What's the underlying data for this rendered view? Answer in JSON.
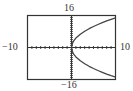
{
  "window": {
    "xmin": "−10",
    "xmax": "10",
    "ymin": "−16",
    "ymax": "16"
  },
  "colors": {
    "frame": "#333333",
    "axis": "#333333",
    "curve": "#444444",
    "background": "#ffffff"
  },
  "chart_data": {
    "type": "line",
    "title": "",
    "xlabel": "",
    "ylabel": "",
    "xlim": [
      -10,
      10
    ],
    "ylim": [
      -16,
      16
    ],
    "grid": false,
    "x_tick_step": 1,
    "y_tick_step": 1,
    "tick_labels": {
      "left": "−10",
      "right": "10",
      "top": "16",
      "bottom": "−16"
    },
    "series": [
      {
        "name": "upper branch",
        "x": [
          0,
          0.25,
          0.5,
          1,
          2,
          3,
          4,
          5,
          6,
          7,
          8,
          9,
          10
        ],
        "y": [
          0,
          2.3,
          3.3,
          4.7,
          6.6,
          8.1,
          9.4,
          10.5,
          11.5,
          12.4,
          13.3,
          14.1,
          14.8
        ]
      },
      {
        "name": "lower branch",
        "x": [
          0,
          0.25,
          0.5,
          1,
          2,
          3,
          4,
          5,
          6,
          7,
          8,
          9,
          10
        ],
        "y": [
          0,
          -2.3,
          -3.3,
          -4.7,
          -6.6,
          -8.1,
          -9.4,
          -10.5,
          -11.5,
          -12.4,
          -13.3,
          -14.1,
          -14.8
        ]
      }
    ],
    "legend": []
  }
}
